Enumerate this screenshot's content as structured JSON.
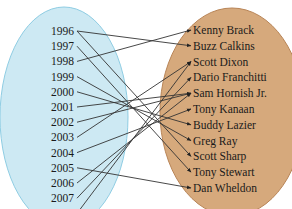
{
  "domain": {
    "title": "Years",
    "fill": "#cde9f3",
    "stroke": "#8fcde3",
    "items": [
      "1996",
      "1997",
      "1998",
      "1999",
      "2000",
      "2001",
      "2002",
      "2003",
      "2004",
      "2005",
      "2006",
      "2007",
      "2008"
    ]
  },
  "codomain": {
    "title": "Champions",
    "fill": "#d6a97c",
    "stroke": "#b88456",
    "items": [
      "Kenny Brack",
      "Buzz Calkins",
      "Scott Dixon",
      "Dario Franchitti",
      "Sam Hornish Jr.",
      "Tony Kanaan",
      "Buddy Lazier",
      "Greg Ray",
      "Scott Sharp",
      "Tony Stewart",
      "Dan Wheldon"
    ]
  },
  "mapping": [
    {
      "from": "1996",
      "to": "Buzz Calkins"
    },
    {
      "from": "1996",
      "to": "Scott Sharp"
    },
    {
      "from": "1997",
      "to": "Tony Stewart"
    },
    {
      "from": "1998",
      "to": "Kenny Brack"
    },
    {
      "from": "1999",
      "to": "Greg Ray"
    },
    {
      "from": "2000",
      "to": "Buddy Lazier"
    },
    {
      "from": "2001",
      "to": "Sam Hornish Jr."
    },
    {
      "from": "2002",
      "to": "Sam Hornish Jr."
    },
    {
      "from": "2003",
      "to": "Scott Dixon"
    },
    {
      "from": "2004",
      "to": "Tony Kanaan"
    },
    {
      "from": "2005",
      "to": "Dan Wheldon"
    },
    {
      "from": "2006",
      "to": "Sam Hornish Jr."
    },
    {
      "from": "2007",
      "to": "Dario Franchitti"
    },
    {
      "from": "2008",
      "to": "Scott Dixon"
    }
  ],
  "colors": {
    "line": "#333333",
    "text": "#1a1a1a"
  }
}
